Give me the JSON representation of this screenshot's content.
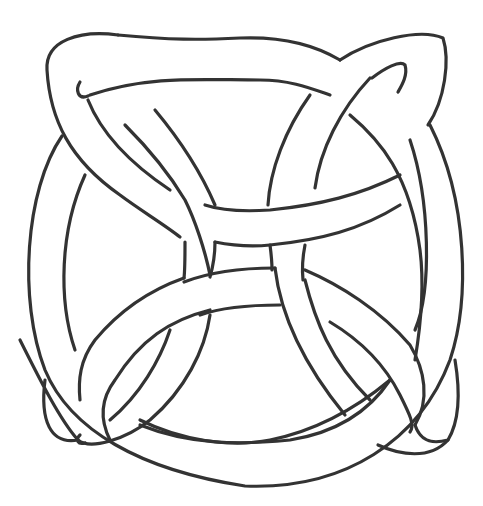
{
  "image": {
    "subject": "Celtic knot line drawing",
    "description": "Black-outlined interlaced band forming a circle crossed by four pointed loops (quaternary Celtic knot), uncolored, on white background",
    "colors": {
      "background": "#ffffff",
      "outline": "#333333"
    }
  }
}
